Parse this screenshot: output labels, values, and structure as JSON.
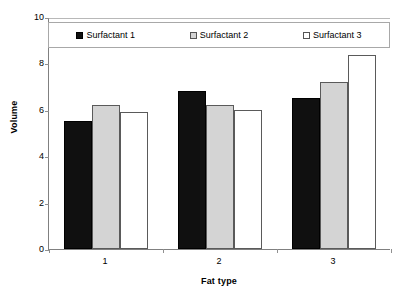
{
  "chart_data": {
    "type": "bar",
    "title": "",
    "xlabel": "Fat type",
    "ylabel": "Volume",
    "categories": [
      "1",
      "2",
      "3"
    ],
    "series": [
      {
        "name": "Surfactant 1",
        "values": [
          5.5,
          6.8,
          6.5
        ],
        "color": "#101010"
      },
      {
        "name": "Surfactant 2",
        "values": [
          6.2,
          6.2,
          7.2
        ],
        "color": "#d4d4d4"
      },
      {
        "name": "Surfactant 3",
        "values": [
          5.9,
          6.0,
          8.35
        ],
        "color": "#ffffff"
      }
    ],
    "ylim": [
      0,
      10
    ],
    "yticks": [
      0,
      2,
      4,
      6,
      8,
      10
    ],
    "ytick_labels": [
      "0",
      "2",
      "4",
      "6",
      "8",
      "10"
    ],
    "xtick_labels": [
      "1",
      "2",
      "3"
    ],
    "grid": false,
    "legend_position": "top-inside",
    "legend_entries": [
      "Surfactant 1",
      "Surfactant 2",
      "Surfactant 3"
    ]
  },
  "axes": {
    "y_title": "Volume",
    "x_title": "Fat type"
  },
  "legend": {
    "items": [
      {
        "label": "Surfactant 1",
        "swatch": "black-square-icon"
      },
      {
        "label": "Surfactant 2",
        "swatch": "gray-square-icon"
      },
      {
        "label": "Surfactant 3",
        "swatch": "white-square-icon"
      }
    ]
  }
}
